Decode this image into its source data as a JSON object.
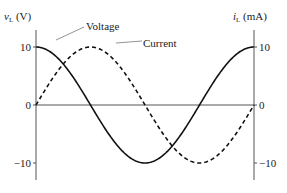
{
  "chart_data": {
    "type": "line",
    "title": "",
    "xlabel": "",
    "ylabel_left": {
      "symbol": "v",
      "subscript": "L",
      "unit": " (V)"
    },
    "ylabel_right": {
      "symbol": "i",
      "subscript": "L",
      "unit": " (mA)"
    },
    "ylim": [
      -10,
      10
    ],
    "xlim": [
      0,
      1
    ],
    "yticks_left": [
      10,
      0,
      -10
    ],
    "yticks_right": [
      10,
      0,
      -10
    ],
    "grid": false,
    "series": [
      {
        "name": "Voltage",
        "function": "10*cos(2*pi*t)",
        "style": "solid",
        "color": "#111111",
        "amplitude": 10,
        "phase_deg": 90
      },
      {
        "name": "Current",
        "function": "10*sin(2*pi*t)",
        "style": "dashed",
        "color": "#111111",
        "amplitude": 10,
        "phase_deg": 0
      }
    ],
    "annotations": [
      {
        "text": "Voltage",
        "points_to": "Voltage"
      },
      {
        "text": "Current",
        "points_to": "Current"
      }
    ]
  }
}
